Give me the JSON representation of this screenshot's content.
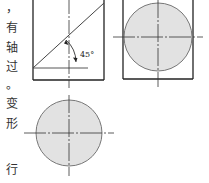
{
  "text_column": {
    "chars": [
      {
        "text": "，",
        "y": 2
      },
      {
        "text": "有",
        "y": 22
      },
      {
        "text": "轴",
        "y": 42
      },
      {
        "text": "过",
        "y": 61
      },
      {
        "text": "。",
        "y": 79
      },
      {
        "text": "变",
        "y": 98
      },
      {
        "text": "形",
        "y": 118
      },
      {
        "text": "行",
        "y": 164
      }
    ]
  },
  "front_view": {
    "angle_label": "45°"
  },
  "colors": {
    "line": "#222222",
    "circle_fill": "#e2e2e2",
    "circle_stroke": "#777777"
  }
}
